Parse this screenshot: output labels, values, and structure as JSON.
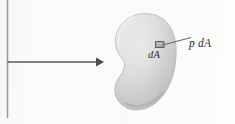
{
  "figure": {
    "kind": "pressure-on-surface-diagram",
    "background_color": "#fbfbfa",
    "labels": {
      "pressure_force": "p dA",
      "area_element": "dA"
    },
    "surface": {
      "name": "curved-surface-blob",
      "fill_light": "#e9e9e9",
      "fill_mid": "#cfcfcf",
      "fill_dark": "#b6b6b6",
      "outline_color": "#b0b0b0"
    },
    "area_element_square": {
      "name": "dA-square",
      "fill": "#a8a8a8",
      "stroke": "#6a6a6a"
    },
    "leader_line": {
      "name": "leader-line-p-dA",
      "color": "#6b6b6b"
    },
    "flow_arrow": {
      "name": "flow-arrow",
      "color": "#5a5a5a",
      "direction": "right"
    },
    "reference_line": {
      "name": "vertical-reference-line",
      "color": "#9b9b9b"
    }
  }
}
